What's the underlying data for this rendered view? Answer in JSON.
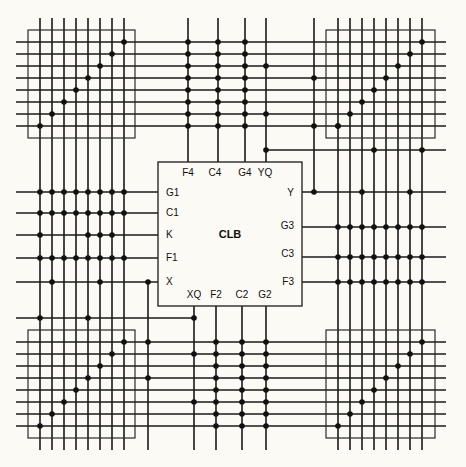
{
  "diagram": {
    "title": "CLB",
    "pins": {
      "top": [
        "F4",
        "C4",
        "G4",
        "YQ"
      ],
      "left": [
        "G1",
        "C1",
        "K",
        "F1",
        "X"
      ],
      "right": [
        "Y",
        "G3",
        "C3",
        "F3"
      ],
      "bottom": [
        "XQ",
        "F2",
        "C2",
        "G2"
      ]
    },
    "switch_matrices": [
      "top-left",
      "top-right",
      "bottom-left",
      "bottom-right"
    ],
    "channel_tracks": 8,
    "colors": {
      "line": "#1a1a1a",
      "background": "#fbfaf5"
    }
  }
}
